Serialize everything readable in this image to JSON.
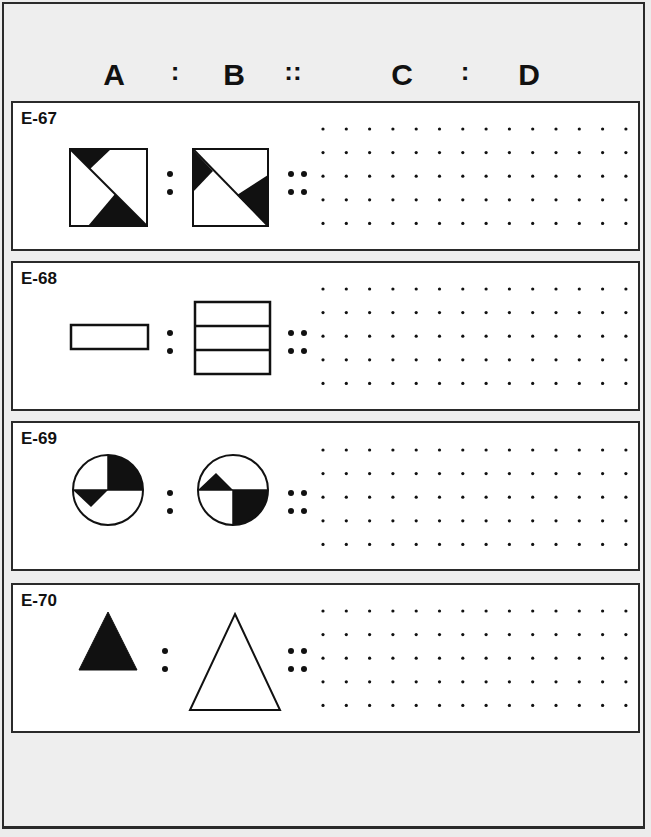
{
  "header": {
    "labels": [
      "A",
      ":",
      "B",
      "::",
      "C",
      ":",
      "D"
    ]
  },
  "panels": [
    {
      "id": "E-67",
      "label": "E-67",
      "figure_a": "square-with-two-black-triangles-left-diagonal",
      "figure_b": "square-with-two-black-triangles-rotated",
      "separator_ab": ":",
      "separator_bc": "::",
      "answer_grid": {
        "rows": 5,
        "cols": 14
      }
    },
    {
      "id": "E-68",
      "label": "E-68",
      "figure_a": "single-horizontal-rectangle",
      "figure_b": "three-stacked-rectangles",
      "separator_ab": ":",
      "separator_bc": "::",
      "answer_grid": {
        "rows": 5,
        "cols": 14
      }
    },
    {
      "id": "E-69",
      "label": "E-69",
      "figure_a": "circle-with-black-quadrant-top-right-and-black-triangle-lower-left",
      "figure_b": "circle-with-black-quadrant-bottom-right-and-black-triangle-upper-left",
      "separator_ab": ":",
      "separator_bc": "::",
      "answer_grid": {
        "rows": 5,
        "cols": 14
      }
    },
    {
      "id": "E-70",
      "label": "E-70",
      "figure_a": "small-filled-black-triangle",
      "figure_b": "large-outlined-white-triangle",
      "separator_ab": ":",
      "separator_bc": "::",
      "answer_grid": {
        "rows": 5,
        "cols": 14
      }
    }
  ],
  "colors": {
    "ink": "#111111",
    "paper": "#ffffff",
    "background": "#eeeeee"
  }
}
